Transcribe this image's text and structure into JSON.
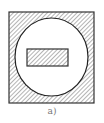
{
  "figure": {
    "caption": "a)",
    "colors": {
      "stroke": "#333333",
      "hatch": "#6a6a6a",
      "fill": "#ffffff",
      "caption": "#777777"
    },
    "shapes": {
      "outer_square": {
        "x": 9,
        "y": 12,
        "width": 85,
        "height": 91,
        "hatched": true
      },
      "circle_cutout": {
        "cx": 51.5,
        "cy": 57,
        "rx": 36.5,
        "ry": 39,
        "hatched": false
      },
      "inner_rectangle": {
        "x": 27,
        "y": 49,
        "width": 41,
        "height": 17,
        "hatched": true
      }
    }
  }
}
